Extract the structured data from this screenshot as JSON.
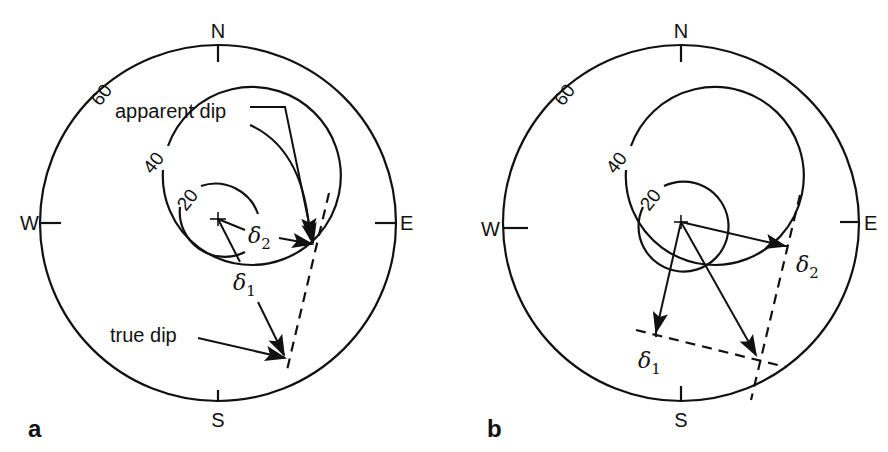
{
  "figure": {
    "panels": [
      {
        "id": "a",
        "label": "a",
        "compass": {
          "north": "N",
          "south": "S",
          "east": "E",
          "west": "W"
        },
        "rings": [
          {
            "value": "20"
          },
          {
            "value": "40"
          },
          {
            "value": "60"
          }
        ],
        "annotations": {
          "apparent_dip": "apparent dip",
          "true_dip": "true dip",
          "delta1_base": "δ",
          "delta1_sub": "1",
          "delta2_base": "δ",
          "delta2_sub": "2"
        }
      },
      {
        "id": "b",
        "label": "b",
        "compass": {
          "north": "N",
          "south": "S",
          "east": "E",
          "west": "W"
        },
        "rings": [
          {
            "value": "20"
          },
          {
            "value": "40"
          },
          {
            "value": "60"
          }
        ],
        "annotations": {
          "delta1_base": "δ",
          "delta1_sub": "1",
          "delta2_base": "δ",
          "delta2_sub": "2"
        }
      }
    ]
  }
}
